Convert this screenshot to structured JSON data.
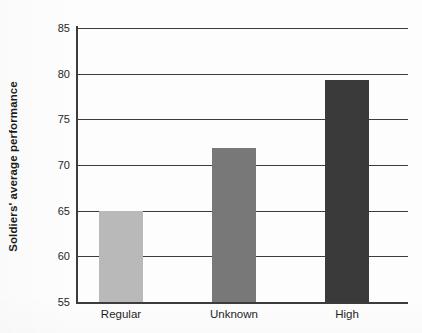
{
  "chart_data": {
    "type": "bar",
    "title": "",
    "subtitle": "",
    "xlabel": "",
    "ylabel": "Soldiers' average performance",
    "categories": [
      "Regular",
      "Unknown",
      "High"
    ],
    "values": [
      65.0,
      71.9,
      79.3
    ],
    "ylim": [
      55,
      85
    ],
    "yticks": [
      55,
      60,
      65,
      70,
      75,
      80,
      85
    ],
    "ytick_labels": [
      "55",
      "60",
      "65",
      "70",
      "75",
      "80",
      "85"
    ],
    "grid": "horizontal",
    "legend": "none",
    "bar_colors": [
      "#b9b9b9",
      "#787878",
      "#3a3a3a"
    ],
    "axis_color": "#3c3c3c",
    "background_color": "#fdfdfd",
    "series": [
      {
        "name": "Soldiers' average performance",
        "values": [
          65.0,
          71.9,
          79.3
        ]
      }
    ]
  }
}
